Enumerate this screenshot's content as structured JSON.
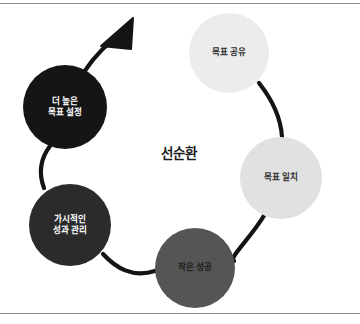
{
  "figure": {
    "center_title": "선순환",
    "center_title_font_size": 13.5,
    "center_title_x": 179,
    "center_title_y": 152,
    "background_color": "#ffffff",
    "frame_color": "#8d8d8d",
    "connector_color": "#141414",
    "connector_width": 4.2
  },
  "nodes": [
    {
      "id": "goal-sharing",
      "label": "목표 공유",
      "cx": 229,
      "cy": 53,
      "r": 40,
      "fill": "#ececec",
      "text_tone": "on-light",
      "font_size": 8.6,
      "label_dx": 0,
      "label_dy": 0
    },
    {
      "id": "goal-alignment",
      "label": "목표 일치",
      "cx": 281,
      "cy": 178,
      "r": 41,
      "fill": "#e1e1e1",
      "text_tone": "on-light",
      "font_size": 8.6,
      "label_dx": 0,
      "label_dy": 0
    },
    {
      "id": "small-wins",
      "label": "작은 성공",
      "cx": 195,
      "cy": 268,
      "r": 40,
      "fill": "#555555",
      "text_tone": "on-mid",
      "font_size": 8.6,
      "label_dx": 0,
      "label_dy": 0
    },
    {
      "id": "visible-performance-management",
      "label": "가시적인\n성과 관리",
      "cx": 70,
      "cy": 225,
      "r": 41,
      "fill": "#2b2b2b",
      "text_tone": "on-dark",
      "font_size": 8.6,
      "label_dx": 0,
      "label_dy": 0
    },
    {
      "id": "set-higher-goals",
      "label": "더 높은\n목표 설정",
      "cx": 65,
      "cy": 107,
      "r": 42,
      "fill": "#151515",
      "text_tone": "on-dark",
      "font_size": 8.6,
      "label_dx": 0,
      "label_dy": 0
    }
  ],
  "connectors": [
    {
      "id": "sharing-to-alignment",
      "path": "M 259,83 C 274,102 281,120 282,137"
    },
    {
      "id": "alignment-to-small-wins",
      "path": "M 265,214 C 251,238 228,258 234,261"
    },
    {
      "id": "small-wins-to-visible",
      "path": "M 155,271 C 132,278 116,268 103,254"
    },
    {
      "id": "visible-to-higher-goals",
      "path": "M 44,188 C 38,172 41,158 50,146"
    },
    {
      "id": "higher-goals-arrow",
      "path": "M 84,72 C 96,54 110,41 123,33"
    }
  ],
  "arrow": {
    "id": "growth-arrow-head",
    "points": "133,18 131,49 101,46",
    "color": "#141414"
  }
}
